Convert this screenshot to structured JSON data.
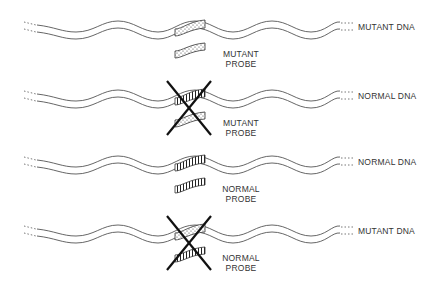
{
  "rows": [
    {
      "dna_label": "MUTANT DNA",
      "probe_label_line1": "MUTANT",
      "probe_label_line2": "PROBE",
      "binds": true,
      "dna_pattern": "dotted",
      "probe_pattern": "dotted"
    },
    {
      "dna_label": "NORMAL DNA",
      "probe_label_line1": "MUTANT",
      "probe_label_line2": "PROBE",
      "binds": false,
      "dna_pattern": "striped",
      "probe_pattern": "dotted"
    },
    {
      "dna_label": "NORMAL DNA",
      "probe_label_line1": "NORMAL",
      "probe_label_line2": "PROBE",
      "binds": true,
      "dna_pattern": "striped",
      "probe_pattern": "striped"
    },
    {
      "dna_label": "MUTANT DNA",
      "probe_label_line1": "NORMAL",
      "probe_label_line2": "PROBE",
      "binds": false,
      "dna_pattern": "dotted",
      "probe_pattern": "striped"
    }
  ],
  "colors": {
    "line": "#555555",
    "cross": "#111111",
    "text": "#333333"
  }
}
